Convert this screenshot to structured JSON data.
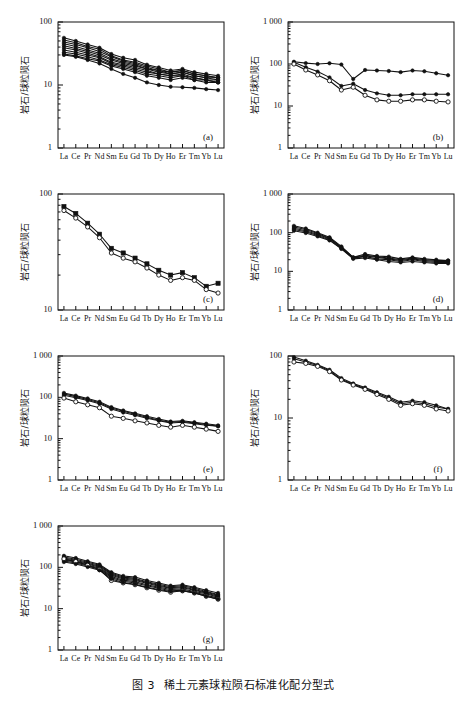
{
  "caption": {
    "figure_number": "图 3",
    "text": "稀土元素球粒陨石标准化配分型式"
  },
  "axis": {
    "ylabel": "岩石/球粒陨石",
    "elements": [
      "La",
      "Ce",
      "Pr",
      "Nd",
      "Sm",
      "Eu",
      "Gd",
      "Tb",
      "Dy",
      "Ho",
      "Er",
      "Tm",
      "Yb",
      "Lu"
    ]
  },
  "chart_data": [
    {
      "type": "line",
      "panel": "(a)",
      "title": "",
      "xlabel": "",
      "ylabel": "岩石/球粒陨石",
      "log_y": true,
      "ylim": [
        1,
        100
      ],
      "yticks": [
        1,
        10,
        100
      ],
      "ytick_labels": [
        "1",
        "10",
        "100"
      ],
      "categories": [
        "La",
        "Ce",
        "Pr",
        "Nd",
        "Sm",
        "Eu",
        "Gd",
        "Tb",
        "Dy",
        "Ho",
        "Er",
        "Tm",
        "Yb",
        "Lu"
      ],
      "series": [
        {
          "name": "a1",
          "marker": "filled",
          "values": [
            56,
            50,
            44,
            39,
            31,
            27,
            25,
            21,
            19,
            17,
            18,
            16,
            15,
            14
          ]
        },
        {
          "name": "a2",
          "marker": "filled",
          "values": [
            52,
            47,
            41,
            37,
            29,
            25,
            23,
            20,
            18,
            16,
            17,
            15,
            14,
            13
          ]
        },
        {
          "name": "a3",
          "marker": "filled",
          "values": [
            48,
            44,
            39,
            34,
            28,
            24,
            22,
            19,
            17,
            16,
            17,
            15,
            14,
            13
          ]
        },
        {
          "name": "a4",
          "marker": "filled",
          "values": [
            45,
            41,
            36,
            32,
            26,
            23,
            21,
            18,
            17,
            15,
            16,
            14,
            13,
            13
          ]
        },
        {
          "name": "a5",
          "marker": "filled",
          "values": [
            42,
            38,
            34,
            30,
            25,
            22,
            20,
            18,
            16,
            15,
            16,
            14,
            13,
            12
          ]
        },
        {
          "name": "a6",
          "marker": "filled",
          "values": [
            39,
            36,
            32,
            28,
            23,
            21,
            19,
            17,
            15,
            14,
            15,
            13,
            12,
            12
          ]
        },
        {
          "name": "a7",
          "marker": "filled",
          "values": [
            36,
            33,
            30,
            27,
            22,
            20,
            18,
            16,
            15,
            14,
            14,
            13,
            12,
            11
          ]
        },
        {
          "name": "a8",
          "marker": "filled",
          "values": [
            33,
            31,
            28,
            25,
            21,
            19,
            17,
            15,
            14,
            13,
            14,
            12,
            12,
            11
          ]
        },
        {
          "name": "a9",
          "marker": "filled",
          "values": [
            31,
            29,
            26,
            24,
            20,
            18,
            16,
            14,
            13,
            12,
            13,
            12,
            11,
            11
          ]
        },
        {
          "name": "a10",
          "marker": "filled",
          "values": [
            30,
            28,
            25,
            22,
            18,
            15,
            13,
            11,
            10,
            9.4,
            9.2,
            9.0,
            8.6,
            8.3
          ]
        }
      ]
    },
    {
      "type": "line",
      "panel": "(b)",
      "title": "",
      "xlabel": "",
      "ylabel": "岩石/球粒陨石",
      "log_y": true,
      "ylim": [
        1,
        1000
      ],
      "yticks": [
        1,
        10,
        100,
        1000
      ],
      "ytick_labels": [
        "1",
        "10",
        "100",
        "1 000"
      ],
      "categories": [
        "La",
        "Ce",
        "Pr",
        "Nd",
        "Sm",
        "Eu",
        "Gd",
        "Tb",
        "Dy",
        "Ho",
        "Er",
        "Tm",
        "Yb",
        "Lu"
      ],
      "series": [
        {
          "name": "b1",
          "marker": "filled",
          "values": [
            113,
            105,
            100,
            104,
            97,
            44,
            72,
            70,
            68,
            64,
            70,
            67,
            60,
            54
          ]
        },
        {
          "name": "b2",
          "marker": "filled",
          "values": [
            110,
            84,
            66,
            48,
            30,
            34,
            24,
            20,
            18,
            18,
            19,
            19,
            19,
            19
          ]
        },
        {
          "name": "b3",
          "marker": "open",
          "values": [
            100,
            72,
            55,
            40,
            24,
            28,
            18,
            14,
            13,
            13,
            14,
            14,
            13,
            12.5
          ]
        }
      ]
    },
    {
      "type": "line",
      "panel": "(c)",
      "title": "",
      "xlabel": "",
      "ylabel": "岩石/球粒陨石",
      "log_y": true,
      "ylim": [
        10,
        100
      ],
      "yticks": [
        10,
        100
      ],
      "ytick_labels": [
        "10",
        "100"
      ],
      "categories": [
        "La",
        "Ce",
        "Pr",
        "Nd",
        "Sm",
        "Eu",
        "Gd",
        "Tb",
        "Dy",
        "Ho",
        "Er",
        "Tm",
        "Yb",
        "Lu"
      ],
      "series": [
        {
          "name": "c1",
          "marker": "filled",
          "values": [
            78,
            68,
            56,
            45,
            34,
            31,
            28,
            25,
            22,
            20,
            21,
            19,
            16,
            17
          ]
        },
        {
          "name": "c2",
          "marker": "open",
          "values": [
            72,
            62,
            52,
            42,
            31,
            28,
            26,
            23,
            20,
            18,
            19,
            18,
            15,
            14
          ]
        }
      ]
    },
    {
      "type": "line",
      "panel": "(d)",
      "title": "",
      "xlabel": "",
      "ylabel": "岩石/球粒陨石",
      "log_y": true,
      "ylim": [
        1,
        1000
      ],
      "yticks": [
        1,
        10,
        100,
        1000
      ],
      "ytick_labels": [
        "1",
        "10",
        "100",
        "1 000"
      ],
      "categories": [
        "La",
        "Ce",
        "Pr",
        "Nd",
        "Sm",
        "Eu",
        "Gd",
        "Tb",
        "Dy",
        "Ho",
        "Er",
        "Tm",
        "Yb",
        "Lu"
      ],
      "series": [
        {
          "name": "d1",
          "marker": "filled",
          "values": [
            150,
            128,
            100,
            76,
            44,
            23,
            28,
            25,
            24,
            21,
            23,
            21,
            20,
            19
          ]
        },
        {
          "name": "d2",
          "marker": "filled",
          "values": [
            140,
            120,
            95,
            72,
            42,
            23,
            26,
            24,
            22,
            20,
            22,
            20,
            19,
            19
          ]
        },
        {
          "name": "d3",
          "marker": "filled",
          "values": [
            130,
            112,
            90,
            70,
            41,
            22,
            25,
            23,
            21,
            19,
            21,
            19,
            18,
            18
          ]
        },
        {
          "name": "d4",
          "marker": "filled",
          "values": [
            120,
            105,
            85,
            66,
            39,
            22,
            24,
            21,
            20,
            18,
            20,
            18,
            17,
            17
          ]
        },
        {
          "name": "d5",
          "marker": "filled",
          "values": [
            112,
            98,
            80,
            63,
            38,
            21,
            22,
            20,
            18,
            17,
            18,
            17,
            16,
            16
          ]
        }
      ]
    },
    {
      "type": "line",
      "panel": "(e)",
      "title": "",
      "xlabel": "",
      "ylabel": "岩石/球粒陨石",
      "log_y": true,
      "ylim": [
        1,
        1000
      ],
      "yticks": [
        1,
        10,
        100,
        1000
      ],
      "ytick_labels": [
        "1",
        "10",
        "100",
        "1 000"
      ],
      "categories": [
        "La",
        "Ce",
        "Pr",
        "Nd",
        "Sm",
        "Eu",
        "Gd",
        "Tb",
        "Dy",
        "Ho",
        "Er",
        "Tm",
        "Yb",
        "Lu"
      ],
      "series": [
        {
          "name": "e1",
          "marker": "filled",
          "values": [
            128,
            110,
            94,
            78,
            58,
            48,
            41,
            35,
            30,
            26,
            27,
            25,
            23,
            21
          ]
        },
        {
          "name": "e2",
          "marker": "filled",
          "values": [
            120,
            104,
            89,
            74,
            55,
            46,
            39,
            33,
            28,
            25,
            26,
            24,
            22,
            20
          ]
        },
        {
          "name": "e3",
          "marker": "filled",
          "values": [
            112,
            98,
            84,
            70,
            52,
            43,
            37,
            31,
            27,
            24,
            25,
            23,
            21,
            20
          ]
        },
        {
          "name": "e4",
          "marker": "open",
          "values": [
            96,
            78,
            66,
            56,
            35,
            31,
            27,
            24,
            21,
            19,
            21,
            19,
            17,
            15
          ]
        }
      ]
    },
    {
      "type": "line",
      "panel": "(f)",
      "title": "",
      "xlabel": "",
      "ylabel": "岩石/球粒陨石",
      "log_y": true,
      "ylim": [
        1,
        100
      ],
      "yticks": [
        1,
        10,
        100
      ],
      "ytick_labels": [
        "1",
        "10",
        "100"
      ],
      "categories": [
        "La",
        "Ce",
        "Pr",
        "Nd",
        "Sm",
        "Eu",
        "Gd",
        "Tb",
        "Dy",
        "Ho",
        "Er",
        "Tm",
        "Yb",
        "Lu"
      ],
      "series": [
        {
          "name": "f1",
          "marker": "filled",
          "values": [
            96,
            84,
            72,
            60,
            44,
            36,
            31,
            26,
            22,
            18,
            19,
            18,
            16,
            14
          ]
        },
        {
          "name": "f2",
          "marker": "filled",
          "values": [
            90,
            80,
            70,
            58,
            42,
            35,
            30,
            25,
            21,
            17,
            18,
            17,
            15,
            14
          ]
        },
        {
          "name": "f3",
          "marker": "open",
          "values": [
            80,
            76,
            68,
            56,
            41,
            34,
            29,
            24,
            20,
            16,
            17,
            16,
            14,
            13
          ]
        }
      ]
    },
    {
      "type": "line",
      "panel": "(g)",
      "title": "",
      "xlabel": "",
      "ylabel": "岩石/球粒陨石",
      "log_y": true,
      "ylim": [
        1,
        1000
      ],
      "yticks": [
        1,
        10,
        100,
        1000
      ],
      "ytick_labels": [
        "1",
        "10",
        "100",
        "1 000"
      ],
      "categories": [
        "La",
        "Ce",
        "Pr",
        "Nd",
        "Sm",
        "Eu",
        "Gd",
        "Tb",
        "Dy",
        "Ho",
        "Er",
        "Tm",
        "Yb",
        "Lu"
      ],
      "series": [
        {
          "name": "g1",
          "marker": "filled",
          "values": [
            190,
            168,
            140,
            118,
            76,
            62,
            58,
            48,
            42,
            36,
            38,
            33,
            28,
            24
          ]
        },
        {
          "name": "g2",
          "marker": "filled",
          "values": [
            178,
            156,
            132,
            112,
            72,
            58,
            54,
            45,
            39,
            34,
            36,
            31,
            26,
            22
          ]
        },
        {
          "name": "g3",
          "marker": "filled",
          "values": [
            168,
            148,
            126,
            106,
            68,
            55,
            51,
            43,
            37,
            32,
            34,
            29,
            25,
            21
          ]
        },
        {
          "name": "g4",
          "marker": "filled",
          "values": [
            158,
            140,
            120,
            100,
            64,
            52,
            48,
            41,
            35,
            31,
            32,
            28,
            24,
            20
          ]
        },
        {
          "name": "g5",
          "marker": "filled",
          "values": [
            150,
            134,
            114,
            95,
            60,
            49,
            45,
            38,
            33,
            29,
            30,
            26,
            23,
            19
          ]
        },
        {
          "name": "g6",
          "marker": "filled",
          "values": [
            142,
            127,
            108,
            90,
            56,
            46,
            42,
            36,
            31,
            27,
            28,
            25,
            21,
            18
          ]
        },
        {
          "name": "g7",
          "marker": "open",
          "values": [
            160,
            138,
            112,
            88,
            48,
            42,
            38,
            32,
            28,
            25,
            27,
            24,
            20,
            17
          ]
        },
        {
          "name": "g8",
          "marker": "filled",
          "values": [
            134,
            120,
            102,
            85,
            52,
            43,
            39,
            33,
            29,
            26,
            27,
            24,
            20,
            17
          ]
        }
      ]
    }
  ]
}
